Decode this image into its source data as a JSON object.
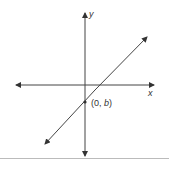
{
  "diagram": {
    "type": "coordinate-plane-line",
    "axes": {
      "x_label": "x",
      "y_label": "y"
    },
    "line": {
      "description": "line with positive slope crossing y-axis below origin"
    },
    "point": {
      "label_prefix": "(0, ",
      "label_var": "b",
      "label_suffix": ")"
    },
    "colors": {
      "line": "#333333",
      "axes": "#333333",
      "rule": "#bbbbbb"
    }
  }
}
